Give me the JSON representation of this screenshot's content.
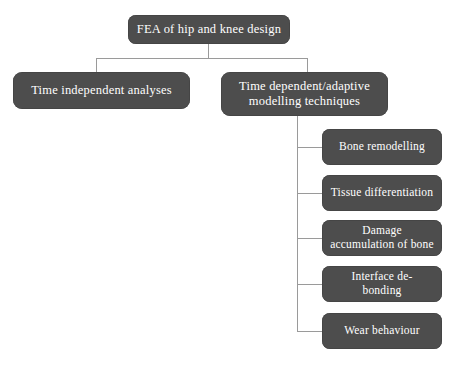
{
  "figure": {
    "type": "hierarchy-tree-diagram",
    "background_color": "#ffffff",
    "node_fill_color": "#4d4d4d",
    "node_text_color": "#ffffff",
    "connector_color": "#9a9a9a",
    "caption": ""
  },
  "tree": {
    "root": {
      "label": "FEA of hip and knee design"
    },
    "level2": [
      {
        "label": "Time independent analyses"
      },
      {
        "label": "Time dependent/adaptive\nmodelling techniques"
      }
    ],
    "level3": [
      {
        "label": "Bone remodelling"
      },
      {
        "label": "Tissue differentiation"
      },
      {
        "label": "Damage\naccumulation of bone"
      },
      {
        "label": "Interface de-\nbonding"
      },
      {
        "label": "Wear behaviour"
      }
    ]
  }
}
